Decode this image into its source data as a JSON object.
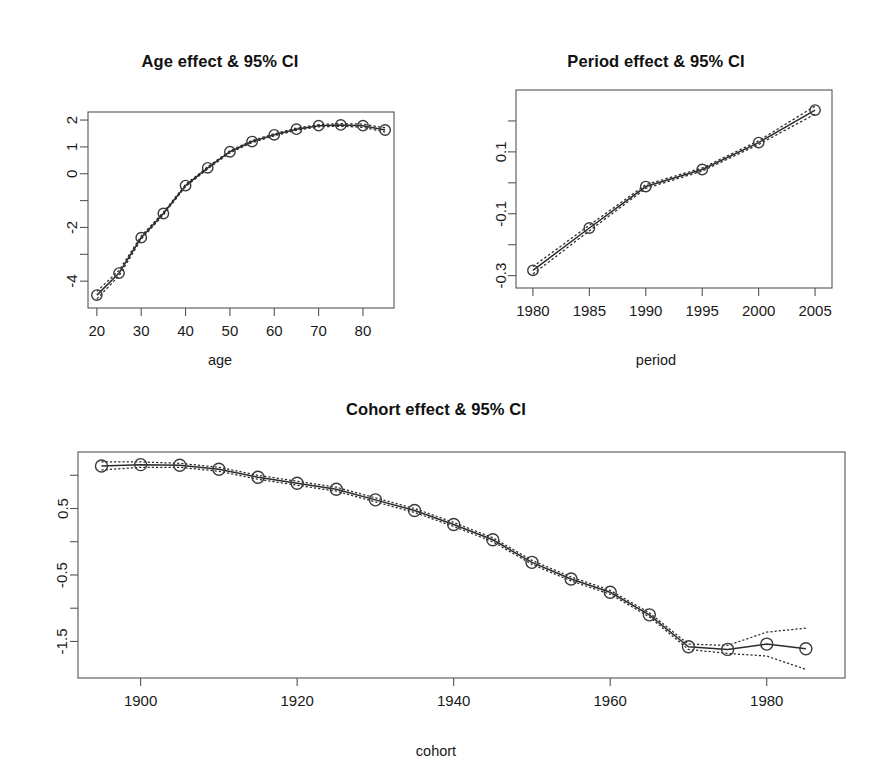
{
  "figure": {
    "background": "#ffffff",
    "line_color": "#2b2b2b",
    "point_color": "#3a3a3a",
    "ci_style": "dashed"
  },
  "panels": {
    "age": {
      "title": "Age effect & 95% CI",
      "xlabel": "age",
      "ylabel": ""
    },
    "period": {
      "title": "Period effect & 95% CI",
      "xlabel": "period",
      "ylabel": ""
    },
    "cohort": {
      "title": "Cohort effect & 95% CI",
      "xlabel": "cohort",
      "ylabel": ""
    }
  },
  "chart_data": [
    {
      "type": "line",
      "name": "age-effect",
      "title": "Age effect & 95% CI",
      "xlabel": "age",
      "ylabel": "",
      "xlim": [
        18,
        87
      ],
      "ylim": [
        -5.0,
        2.3
      ],
      "xticks": [
        20,
        30,
        40,
        50,
        60,
        70,
        80
      ],
      "xtick_labels": [
        "20",
        "30",
        "40",
        "50",
        "60",
        "70",
        "80"
      ],
      "yticks": [
        -4,
        -3,
        -2,
        -1,
        0,
        1,
        2
      ],
      "ytick_labels": [
        "-4",
        "",
        "-2",
        "",
        "0",
        "1",
        "2"
      ],
      "grid": false,
      "legend": "none",
      "x": [
        20,
        25,
        30,
        35,
        40,
        45,
        50,
        55,
        60,
        65,
        70,
        75,
        80,
        85
      ],
      "series": [
        {
          "name": "estimate",
          "values": [
            -4.52,
            -3.7,
            -2.38,
            -1.48,
            -0.44,
            0.22,
            0.82,
            1.2,
            1.45,
            1.66,
            1.79,
            1.82,
            1.79,
            1.63
          ]
        },
        {
          "name": "lower-95",
          "values": [
            -4.66,
            -3.8,
            -2.44,
            -1.53,
            -0.48,
            0.18,
            0.78,
            1.16,
            1.41,
            1.62,
            1.75,
            1.77,
            1.73,
            1.55
          ]
        },
        {
          "name": "upper-95",
          "values": [
            -4.38,
            -3.6,
            -2.32,
            -1.43,
            -0.4,
            0.26,
            0.86,
            1.24,
            1.49,
            1.7,
            1.83,
            1.87,
            1.85,
            1.71
          ]
        }
      ]
    },
    {
      "type": "line",
      "name": "period-effect",
      "title": "Period effect & 95% CI",
      "xlabel": "period",
      "ylabel": "",
      "xlim": [
        1978.5,
        2006.5
      ],
      "ylim": [
        -0.34,
        0.3
      ],
      "xticks": [
        1980,
        1985,
        1990,
        1995,
        2000,
        2005
      ],
      "xtick_labels": [
        "1980",
        "1985",
        "1990",
        "1995",
        "2000",
        "2005"
      ],
      "yticks": [
        -0.3,
        -0.2,
        -0.1,
        0.0,
        0.1,
        0.2
      ],
      "ytick_labels": [
        "-0.3",
        "",
        "-0.1",
        "",
        "0.1",
        ""
      ],
      "grid": false,
      "legend": "none",
      "x": [
        1980,
        1985,
        1990,
        1995,
        2000,
        2005
      ],
      "series": [
        {
          "name": "estimate",
          "values": [
            -0.283,
            -0.146,
            -0.012,
            0.043,
            0.13,
            0.235
          ]
        },
        {
          "name": "lower-95",
          "values": [
            -0.295,
            -0.155,
            -0.018,
            0.038,
            0.124,
            0.222
          ]
        },
        {
          "name": "upper-95",
          "values": [
            -0.271,
            -0.137,
            -0.006,
            0.048,
            0.136,
            0.248
          ]
        }
      ]
    },
    {
      "type": "line",
      "name": "cohort-effect",
      "title": "Cohort effect & 95% CI",
      "xlabel": "cohort",
      "ylabel": "",
      "xlim": [
        1892,
        1990
      ],
      "ylim": [
        -2.05,
        1.35
      ],
      "xticks": [
        1900,
        1920,
        1940,
        1960,
        1980
      ],
      "xtick_labels": [
        "1900",
        "1920",
        "1940",
        "1960",
        "1980"
      ],
      "yticks": [
        -1.5,
        -1.0,
        -0.5,
        0.0,
        0.5,
        1.0
      ],
      "ytick_labels": [
        "-1.5",
        "",
        "-0.5",
        "",
        "0.5",
        ""
      ],
      "grid": false,
      "legend": "none",
      "x": [
        1895,
        1900,
        1905,
        1910,
        1915,
        1920,
        1925,
        1930,
        1935,
        1940,
        1945,
        1950,
        1955,
        1960,
        1965,
        1970,
        1975,
        1980,
        1985
      ],
      "series": [
        {
          "name": "estimate",
          "values": [
            1.14,
            1.16,
            1.15,
            1.09,
            0.97,
            0.88,
            0.79,
            0.63,
            0.47,
            0.26,
            0.03,
            -0.31,
            -0.56,
            -0.76,
            -1.1,
            -1.58,
            -1.62,
            -1.54,
            -1.61
          ]
        },
        {
          "name": "lower-95",
          "values": [
            1.08,
            1.12,
            1.12,
            1.06,
            0.94,
            0.85,
            0.76,
            0.6,
            0.44,
            0.23,
            0.0,
            -0.34,
            -0.59,
            -0.79,
            -1.13,
            -1.62,
            -1.68,
            -1.72,
            -1.92
          ]
        },
        {
          "name": "upper-95",
          "values": [
            1.2,
            1.2,
            1.18,
            1.12,
            1.0,
            0.91,
            0.82,
            0.66,
            0.5,
            0.29,
            0.06,
            -0.28,
            -0.53,
            -0.73,
            -1.07,
            -1.54,
            -1.56,
            -1.36,
            -1.3
          ]
        }
      ]
    }
  ]
}
